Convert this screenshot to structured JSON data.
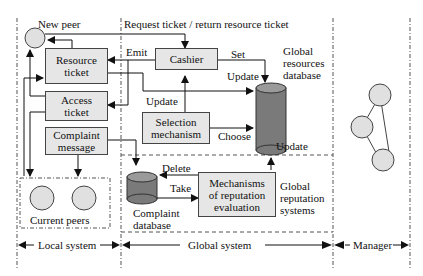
{
  "diagram": {
    "regions": {
      "local": "Local system",
      "global": "Global system",
      "manager": "Manager"
    },
    "labels": {
      "new_peer": "New peer",
      "request_ticket": "Request ticket / return resource ticket",
      "emit": "Emit",
      "set": "Set",
      "update_top": "Update",
      "update_left": "Update",
      "choose": "Choose",
      "update_right": "Update",
      "delete": "Delete",
      "take": "Take",
      "global_resources_db": [
        "Global",
        "resources",
        "database"
      ],
      "global_reputation": [
        "Global",
        "reputation",
        "systems"
      ],
      "complaint_db": [
        "Complaint",
        "database"
      ],
      "current_peers": "Current peers"
    },
    "boxes": {
      "resource_ticket": [
        "Resource",
        "ticket"
      ],
      "access_ticket": [
        "Access",
        "ticket"
      ],
      "complaint_message": [
        "Complaint",
        "message"
      ],
      "cashier": [
        "Cashier"
      ],
      "selection": [
        "Selection",
        "mechanism"
      ],
      "reputation_eval": [
        "Mechanisms",
        "of reputation",
        "evaluation"
      ]
    },
    "colors": {
      "box_fill": "#e6e6e6",
      "node_fill": "#e0e0e0",
      "db_fill": "#7a7a7a",
      "line": "#222222"
    }
  }
}
